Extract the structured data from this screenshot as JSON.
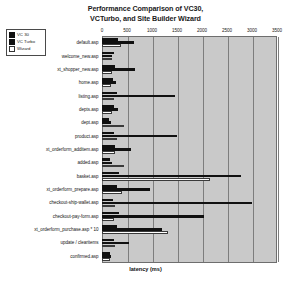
{
  "chart_data": {
    "type": "bar",
    "orientation": "horizontal",
    "title": "Performance Comparison of VC30, VCTurbo, and Site Builder Wizard",
    "title_lines": [
      "Performance Comparison of VC30,",
      "VCTurbo, and Site Builder Wizard"
    ],
    "xlabel": "latency (ms)",
    "ylabel": "",
    "xlim": [
      0,
      3500
    ],
    "xticks": [
      0,
      500,
      1000,
      1500,
      2000,
      2500,
      3000,
      3500
    ],
    "grid": true,
    "legend_position": "top-left",
    "categories": [
      "default.asp",
      "welcome_new.asp",
      "xt_shopper_new.asp",
      "home.asp",
      "listing.asp",
      "depts.asp",
      "dept.asp",
      "product.asp",
      "xt_orderform_additem.asp",
      "added.asp",
      "basket.asp",
      "xt_orderform_prepare.asp",
      "checkout-ship-wallet.asp",
      "checkout-pay-form.asp",
      "xt_orderform_purchase.asp * 10",
      "update / clearitems",
      "confirmed.asp"
    ],
    "series": [
      {
        "name": "VC 30",
        "color": "#101010",
        "values": [
          320,
          240,
          260,
          220,
          300,
          240,
          130,
          240,
          250,
          160,
          330,
          300,
          220,
          330,
          300,
          230,
          160
        ]
      },
      {
        "name": "VC Turbo",
        "color": "#101010",
        "values": [
          640,
          200,
          660,
          270,
          1460,
          320,
          180,
          1500,
          580,
          200,
          2780,
          960,
          3000,
          2030,
          1200,
          530,
          170
        ]
      },
      {
        "name": "Wizard",
        "color": "#ffffff",
        "values": [
          380,
          190,
          200,
          170,
          240,
          190,
          430,
          300,
          250,
          430,
          2150,
          400,
          260,
          240,
          1320,
          250,
          150
        ]
      }
    ]
  },
  "legend": {
    "items": [
      {
        "label": "VC 30",
        "style": "fill"
      },
      {
        "label": "VC Turbo",
        "style": "fill"
      },
      {
        "label": "Wizard",
        "style": "hollow"
      }
    ]
  }
}
